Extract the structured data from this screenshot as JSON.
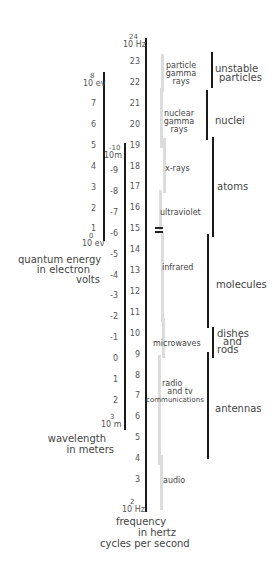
{
  "chart_data": {
    "type": "diagram",
    "scales": {
      "frequency": {
        "title": [
          "frequency",
          "in hertz",
          "cycles per second"
        ],
        "top_label": {
          "base": "10",
          "exp": "24",
          "unit": "Hz"
        },
        "bottom_label": {
          "base": "10",
          "exp": "2",
          "unit": "Hz"
        },
        "ticks": [
          "23",
          "22",
          "21",
          "20",
          "19",
          "18",
          "17",
          "16",
          "15",
          "14",
          "13",
          "12",
          "11",
          "10",
          "9",
          "8",
          "7",
          "6",
          "5",
          "4",
          "3"
        ]
      },
      "wavelength": {
        "title": [
          "wavelength",
          "in meters"
        ],
        "top_label": {
          "base": "10",
          "exp": "-10",
          "unit": "m"
        },
        "bottom_label": {
          "base": "10",
          "exp": "3",
          "unit": "m"
        },
        "ticks": [
          "-9",
          "-8",
          "-7",
          "-6",
          "-5",
          "-4",
          "-3",
          "-2",
          "-1",
          "0",
          "1",
          "2"
        ]
      },
      "energy": {
        "title": [
          "quantum energy",
          "in electron",
          "volts"
        ],
        "top_label": {
          "base": "10",
          "exp": "8",
          "unit": "ev"
        },
        "bottom_label": {
          "base": "10",
          "exp": "0",
          "unit": "ev"
        },
        "ticks": [
          "7",
          "6",
          "5",
          "4",
          "3",
          "2",
          "1"
        ]
      }
    },
    "bands": [
      {
        "name": "particle gamma rays",
        "lines": [
          "particle",
          "gamma",
          "rays"
        ]
      },
      {
        "name": "nuclear gamma rays",
        "lines": [
          "nuclear",
          "gamma",
          "rays"
        ]
      },
      {
        "name": "x-rays",
        "lines": [
          "x-rays"
        ]
      },
      {
        "name": "ultraviolet",
        "lines": [
          "ultraviolet"
        ]
      },
      {
        "name": "visible",
        "marker": "="
      },
      {
        "name": "infrared",
        "lines": [
          "infrared"
        ]
      },
      {
        "name": "microwaves",
        "lines": [
          "microwaves"
        ]
      },
      {
        "name": "radio and tv communications",
        "lines": [
          "radio",
          "and tv",
          "communications"
        ]
      },
      {
        "name": "audio",
        "lines": [
          "audio"
        ]
      }
    ],
    "sources": [
      {
        "name": "unstable particles",
        "lines": [
          "unstable",
          "particles"
        ]
      },
      {
        "name": "nuclei",
        "lines": [
          "nuclei"
        ]
      },
      {
        "name": "atoms",
        "lines": [
          "atoms"
        ]
      },
      {
        "name": "molecules",
        "lines": [
          "molecules"
        ]
      },
      {
        "name": "dishes and rods",
        "lines": [
          "dishes",
          "and",
          "rods"
        ]
      },
      {
        "name": "antennas",
        "lines": [
          "antennas"
        ]
      }
    ]
  }
}
